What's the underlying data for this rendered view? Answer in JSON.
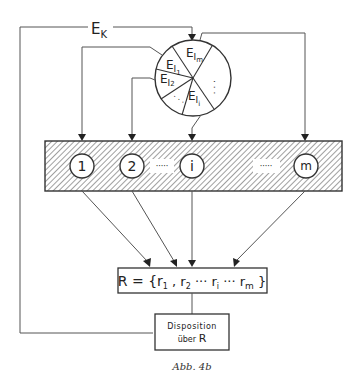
{
  "diagram": {
    "feedback_label": "E",
    "feedback_sub": "K",
    "pie": {
      "segments": [
        {
          "main": "E",
          "sub": "I",
          "subsub": "1"
        },
        {
          "main": "E",
          "sub": "I",
          "subsub": "2"
        },
        {
          "main": "E",
          "sub": "I",
          "subsub": "i"
        },
        {
          "main": "E",
          "sub": "I",
          "subsub": "m"
        }
      ],
      "ellipsis": "· · ·"
    },
    "units": [
      {
        "label": "1"
      },
      {
        "label": "2"
      },
      {
        "label": "i"
      },
      {
        "label": "m"
      }
    ],
    "unit_ellipsis": "·····",
    "result_box": {
      "prefix": "R = {r",
      "s1": "1",
      "mid1": " , r",
      "s2": "2",
      "mid2": " ··· r",
      "si": "i",
      "mid3": " ··· r",
      "sm": "m",
      "suffix": " }"
    },
    "disposition_box": {
      "line1": "Disposition",
      "line2_prefix": "über ",
      "line2_R": "R"
    },
    "caption": "Abb. 4b"
  },
  "colors": {
    "line": "#555555",
    "hatch": "#666666",
    "text": "#222222"
  }
}
